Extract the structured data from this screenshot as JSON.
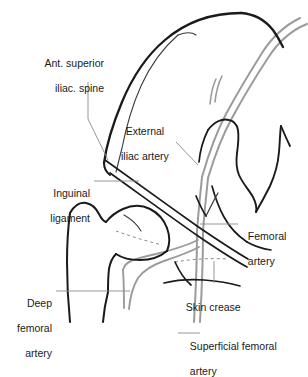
{
  "figure": {
    "type": "anatomical-line-diagram",
    "colors": {
      "bone_outline": "#1a1a1a",
      "bone_outline_thin": "#3a3a3a",
      "artery": "#9b9b9b",
      "artery_fill": "#ffffff",
      "leader_line": "#8a8a8a",
      "dashed_line": "#8a8a8a",
      "label_text": "#1a1a1a",
      "background": "#ffffff"
    }
  },
  "labels": {
    "ant_superior_iliac_spine": {
      "line1": "Ant. superior",
      "line2": "iliac. spine"
    },
    "external_iliac_artery": {
      "line1": "External",
      "line2": "iliac artery"
    },
    "inguinal_ligament": {
      "line1": "Inguinal",
      "line2": "ligament"
    },
    "femoral_artery": {
      "line1": "Femoral",
      "line2": "artery"
    },
    "deep_femoral_artery": {
      "line1": "Deep",
      "line2": "femoral",
      "line3": "artery"
    },
    "skin_crease": {
      "line1": "Skin crease"
    },
    "superficial_femoral_artery": {
      "line1": "Superficial femoral",
      "line2": "artery"
    }
  },
  "structures": [
    {
      "name": "iliac-crest",
      "kind": "bone"
    },
    {
      "name": "inner-pelvic-brim",
      "kind": "bone"
    },
    {
      "name": "pubis-ischium",
      "kind": "bone"
    },
    {
      "name": "femur-head-and-trochanter",
      "kind": "bone"
    },
    {
      "name": "femoral-shaft",
      "kind": "bone"
    },
    {
      "name": "femoral-neck-dashed",
      "kind": "dashed"
    },
    {
      "name": "skin-crease-dashed",
      "kind": "dashed"
    },
    {
      "name": "inguinal-ligament-band",
      "kind": "ligament"
    },
    {
      "name": "external-iliac-artery-vessel",
      "kind": "artery"
    },
    {
      "name": "femoral-artery-vessel",
      "kind": "artery"
    },
    {
      "name": "deep-femoral-artery-vessel",
      "kind": "artery"
    },
    {
      "name": "superficial-femoral-artery-vessel",
      "kind": "artery"
    }
  ]
}
